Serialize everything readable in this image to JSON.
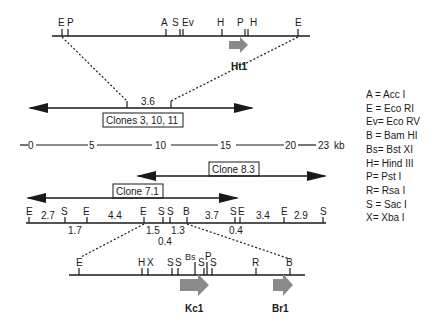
{
  "top_map": {
    "sites": [
      "E",
      "P",
      "A",
      "S",
      "Ev",
      "H",
      "P",
      "H",
      "E"
    ],
    "gene_label": "Ht1"
  },
  "clone_3_10_11": {
    "label": "Clones 3, 10, 11",
    "segment_size": "3.6"
  },
  "scale": {
    "ticks": [
      "0",
      "5",
      "10",
      "15",
      "20",
      "23"
    ],
    "unit": "kb"
  },
  "clone_8_3": {
    "label": "Clone 8.3"
  },
  "clone_7_1": {
    "label": "Clone 7.1"
  },
  "main_map": {
    "sites": [
      "E",
      "S",
      "E",
      "E",
      "S",
      "S",
      "B",
      "S",
      "E",
      "E",
      "S"
    ],
    "sizes_above": [
      "2.7",
      "4.4",
      "3.7",
      "3.4",
      "2.9"
    ],
    "sizes_below": [
      "1.7",
      "1.5",
      "1.3",
      "0.4",
      "0.4"
    ]
  },
  "bottom_map": {
    "sites": [
      "E",
      "H",
      "X",
      "S",
      "S",
      "Bs",
      "S",
      "P",
      "S",
      "R",
      "B"
    ],
    "genes": [
      "Kc1",
      "Br1"
    ]
  },
  "legend": [
    "A = Acc I",
    "E = Eco RI",
    "Ev= Eco RV",
    "B = Bam HI",
    "Bs= Bst XI",
    "H= Hind III",
    "P= Pst I",
    "R= Rsa I",
    "S = Sac I",
    "X= Xba I"
  ],
  "colors": {
    "line": "#1a1a1a",
    "gene_arrow": "#8a8a8a"
  }
}
